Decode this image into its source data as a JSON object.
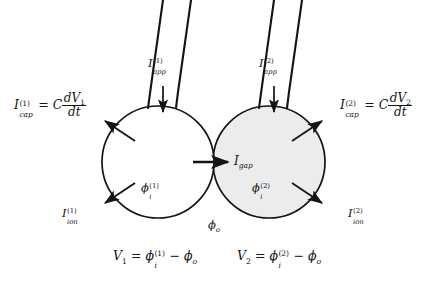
{
  "figure": {
    "type": "two-cell-gap-junction-circuit-diagram",
    "background_color": "#ffffff",
    "stroke_color": "#141414"
  },
  "cells": [
    {
      "id": "cell-1",
      "fill_color": "#ffffff",
      "interior_potential": {
        "symbol": "ϕ",
        "sub": "i",
        "sup": "(1)"
      }
    },
    {
      "id": "cell-2",
      "fill_color": "#ececec",
      "interior_potential": {
        "symbol": "ϕ",
        "sub": "i",
        "sup": "(2)"
      }
    }
  ],
  "labels": {
    "cap_1": {
      "current": "I",
      "sup": "(1)",
      "sub": "cap",
      "equals": "=",
      "coefficient": "C",
      "numerator": "dV",
      "numerator_sub": "1",
      "denominator": "dt"
    },
    "cap_2": {
      "current": "I",
      "sup": "(2)",
      "sub": "cap",
      "equals": "=",
      "coefficient": "C",
      "numerator": "dV",
      "numerator_sub": "2",
      "denominator": "dt"
    },
    "app_1": {
      "current": "I",
      "sup": "(1)",
      "sub": "app"
    },
    "app_2": {
      "current": "I",
      "sup": "(2)",
      "sub": "app"
    },
    "ion_1": {
      "current": "I",
      "sup": "(1)",
      "sub": "ion"
    },
    "ion_2": {
      "current": "I",
      "sup": "(2)",
      "sub": "ion"
    },
    "gap": {
      "current": "I",
      "sub": "gap"
    },
    "phi_i_1": {
      "symbol": "ϕ",
      "sub": "i",
      "sup": "(1)"
    },
    "phi_i_2": {
      "symbol": "ϕ",
      "sub": "i",
      "sup": "(2)"
    },
    "phi_o": {
      "symbol": "ϕ",
      "sub": "o"
    },
    "v1": {
      "lhs": "V",
      "lhs_sub": "1",
      "equals": "=",
      "phi": "ϕ",
      "phi_sub": "i",
      "phi_sup": "(1)",
      "minus": "−",
      "phi_o": "ϕ",
      "phi_o_sub": "o"
    },
    "v2": {
      "lhs": "V",
      "lhs_sub": "2",
      "equals": "=",
      "phi": "ϕ",
      "phi_sub": "i",
      "phi_sup": "(2)",
      "minus": "−",
      "phi_o": "ϕ",
      "phi_o_sub": "o"
    }
  }
}
